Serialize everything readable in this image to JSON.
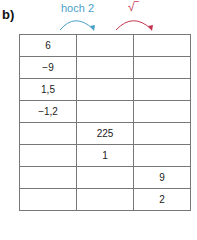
{
  "label": "b)",
  "operations": [
    {
      "text": "hoch 2",
      "color": "#4a9fc7"
    },
    {
      "text": "√‾",
      "color": "#c2344f"
    }
  ],
  "table": {
    "rows": [
      [
        "6",
        "",
        ""
      ],
      [
        "−9",
        "",
        ""
      ],
      [
        "1,5",
        "",
        ""
      ],
      [
        "−1,2",
        "",
        ""
      ],
      [
        "",
        "225",
        ""
      ],
      [
        "",
        "1",
        ""
      ],
      [
        "",
        "",
        "9"
      ],
      [
        "",
        "",
        "2"
      ]
    ]
  }
}
